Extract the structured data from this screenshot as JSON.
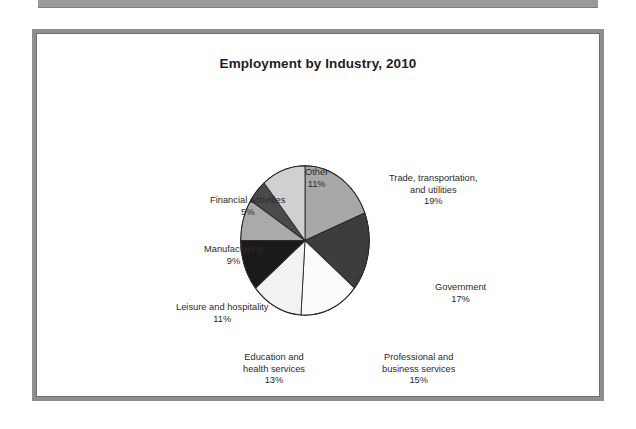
{
  "page": {
    "background": "#ffffff",
    "frame_color": "#8e8e8e",
    "scan_bar_color": "#9a9a9a"
  },
  "figure": {
    "title": "Employment by Industry, 2010"
  },
  "chart_data": {
    "type": "pie",
    "title": "Employment by Industry, 2010",
    "xlabel": "",
    "ylabel": "",
    "legend_position": "outside-labels",
    "grid": false,
    "start_angle_deg": 0,
    "direction": "clockwise",
    "categories": [
      "Trade, transportation, and utilities",
      "Government",
      "Professional and business services",
      "Education and health services",
      "Leisure and hospitality",
      "Manufacturing",
      "Financial activities",
      "Other"
    ],
    "values": [
      19,
      17,
      15,
      13,
      11,
      9,
      5,
      11
    ],
    "unit": "%",
    "colors": [
      "#a8a8a8",
      "#3d3d3d",
      "#fbfbfb",
      "#f2f2f2",
      "#1a1a1a",
      "#aaaaaa",
      "#4a4a4a",
      "#d0d0d0"
    ],
    "slices": [
      {
        "label_line1": "Trade, transportation,",
        "label_line2": "and utilities",
        "percent": "19%",
        "value": 19,
        "color": "#a8a8a8"
      },
      {
        "label_line1": "Government",
        "label_line2": "",
        "percent": "17%",
        "value": 17,
        "color": "#3d3d3d"
      },
      {
        "label_line1": "Professional and",
        "label_line2": "business services",
        "percent": "15%",
        "value": 15,
        "color": "#fbfbfb"
      },
      {
        "label_line1": "Education and",
        "label_line2": "health services",
        "percent": "13%",
        "value": 13,
        "color": "#f2f2f2"
      },
      {
        "label_line1": "Leisure and hospitality",
        "label_line2": "",
        "percent": "11%",
        "value": 11,
        "color": "#1a1a1a"
      },
      {
        "label_line1": "Manufacturing",
        "label_line2": "",
        "percent": "9%",
        "value": 9,
        "color": "#aaaaaa"
      },
      {
        "label_line1": "Financial activities",
        "label_line2": "",
        "percent": "5%",
        "value": 5,
        "color": "#4a4a4a"
      },
      {
        "label_line1": "Other",
        "label_line2": "",
        "percent": "11%",
        "value": 11,
        "color": "#d0d0d0"
      }
    ]
  }
}
